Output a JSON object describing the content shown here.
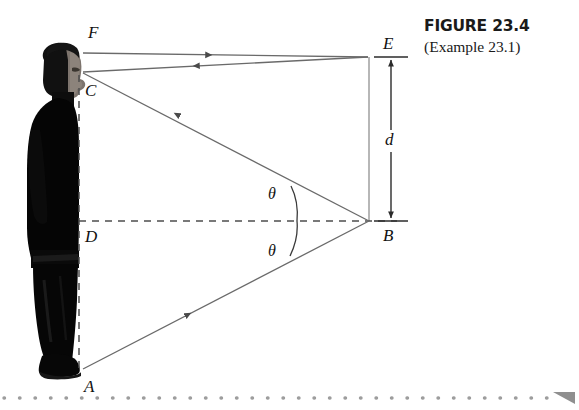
{
  "figure": {
    "caption_title": "FIGURE 23.4",
    "caption_subtitle": "(Example 23.1)",
    "labels": {
      "F": "F",
      "E": "E",
      "C": "C",
      "D": "D",
      "A": "A",
      "B": "B",
      "d": "d",
      "theta_upper": "θ",
      "theta_lower": "θ"
    },
    "colors": {
      "ray": "#5a5a5a",
      "arrowhead": "#4a4a4a",
      "dashed": "#4d4d4d",
      "mirror": "#9a9a9a",
      "dimension": "#2b2b2b",
      "text": "#111111",
      "caption": "#1a1a1a",
      "rule_dots": "#9d9d9d",
      "figure_bg": "#ffffff",
      "person_dark": "#0a0a0a",
      "person_skin": "#7d746d"
    }
  }
}
